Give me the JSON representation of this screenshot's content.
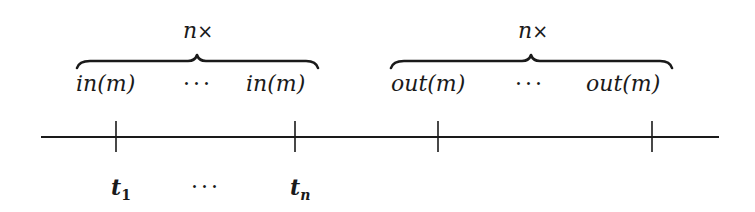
{
  "diagram": {
    "type": "timeline",
    "groups": [
      {
        "multiplier_label": "n",
        "multiplier_symbol": "×",
        "items": [
          "in(m)",
          "in(m)"
        ],
        "ellipsis": "···"
      },
      {
        "multiplier_label": "n",
        "multiplier_symbol": "×",
        "items": [
          "out(m)",
          "out(m)"
        ],
        "ellipsis": "···"
      }
    ],
    "timeline": {
      "ticks": 4,
      "tick_labels": {
        "first": {
          "base": "t",
          "sub": "1"
        },
        "ellipsis": "···",
        "last": {
          "base": "t",
          "sub": "n"
        }
      }
    },
    "colors": {
      "ink": "#1a1a1a",
      "background": "#ffffff"
    }
  }
}
